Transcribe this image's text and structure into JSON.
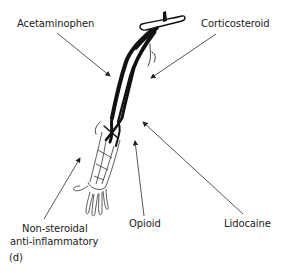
{
  "figure": {
    "panel_label": "(d)",
    "labels": {
      "acetaminophen": "Acetaminophen",
      "corticosteroid": "Corticosteroid",
      "nsaid_line1": "Non-steroidal",
      "nsaid_line2": "anti-inflammatory",
      "opioid": "Opioid",
      "lidocaine": "Lidocaine"
    },
    "colors": {
      "ink": "#111111",
      "arrow": "#444444",
      "background": "#ffffff"
    }
  }
}
